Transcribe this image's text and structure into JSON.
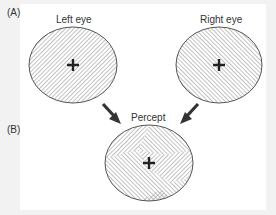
{
  "figure": {
    "panel_labels": {
      "a": "(A)",
      "b": "(B)"
    },
    "eyes": {
      "left": {
        "label": "Left eye",
        "hatch_direction": "forward-diagonal"
      },
      "right": {
        "label": "Right eye",
        "hatch_direction": "backward-diagonal"
      }
    },
    "percept": {
      "label": "Percept",
      "pattern": "patchwork of both hatch orientations"
    },
    "fixation_mark": "+",
    "arrows": [
      "left-eye-to-percept",
      "right-eye-to-percept"
    ],
    "colors": {
      "background": "#f2f2f2",
      "panel": "#ffffff",
      "stroke": "#555555",
      "arrow": "#333333",
      "text": "#333333"
    }
  }
}
